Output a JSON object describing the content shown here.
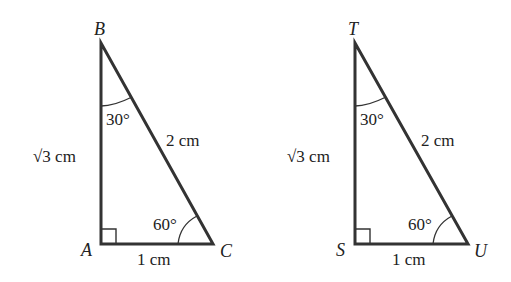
{
  "diagram": {
    "type": "geometry-similar-triangles",
    "stroke_color": "#333333",
    "triangles": [
      {
        "name": "ABC",
        "vertices": {
          "top": {
            "label": "B",
            "x": 101,
            "y": 43
          },
          "right_angle": {
            "label": "A",
            "x": 101,
            "y": 244
          },
          "acute": {
            "label": "C",
            "x": 213,
            "y": 244
          }
        },
        "sides": {
          "vertical": "√3 cm",
          "hypotenuse": "2 cm",
          "base": "1 cm"
        },
        "angles": {
          "top": "30°",
          "acute": "60°"
        }
      },
      {
        "name": "TSU",
        "vertices": {
          "top": {
            "label": "T",
            "x": 355,
            "y": 43
          },
          "right_angle": {
            "label": "S",
            "x": 355,
            "y": 244
          },
          "acute": {
            "label": "U",
            "x": 468,
            "y": 244
          }
        },
        "sides": {
          "vertical": "√3 cm",
          "hypotenuse": "2 cm",
          "base": "1 cm"
        },
        "angles": {
          "top": "30°",
          "acute": "60°"
        }
      }
    ]
  }
}
